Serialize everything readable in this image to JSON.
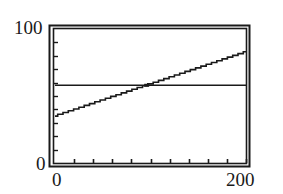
{
  "chart_data": {
    "type": "line",
    "title": "",
    "xlabel": "",
    "ylabel": "",
    "xlim": [
      0,
      200
    ],
    "ylim": [
      0,
      100
    ],
    "x_tick_spacing": 20,
    "y_tick_spacing": 10,
    "tick_labels": {
      "x_min": "0",
      "x_max": "200",
      "y_min": "0",
      "y_max": "100"
    },
    "grid": false,
    "legend": null,
    "series": [
      {
        "name": "sloped-line",
        "x": [
          0,
          200
        ],
        "values": [
          35,
          83
        ],
        "style": "stepped-pixel line"
      },
      {
        "name": "horizontal-line",
        "x": [
          0,
          200
        ],
        "values": [
          58,
          58
        ],
        "style": "solid"
      }
    ],
    "annotations": [
      {
        "label": "intersection",
        "x": 96,
        "y": 58
      }
    ]
  },
  "labels": {
    "y_max": "100",
    "y_min": "0",
    "x_min": "0",
    "x_max": "200"
  },
  "colors": {
    "line": "#1a1a1a",
    "frame": "#1a1a1a",
    "background": "#ffffff"
  }
}
